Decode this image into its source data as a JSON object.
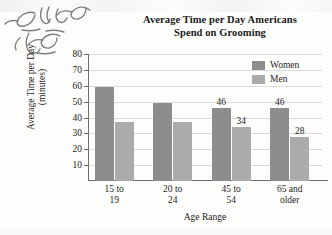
{
  "annotation": {
    "note": "handwritten-pencil-arabic-script",
    "ink_color": "#6b6b6b"
  },
  "legend": {
    "position": "top-right",
    "entries": [
      {
        "label": "Women",
        "color": "#8d8d8d"
      },
      {
        "label": "Men",
        "color": "#ababab"
      }
    ]
  },
  "chart_data": {
    "type": "bar",
    "title": "Average Time per Day Americans Spend on Grooming",
    "title_lines": [
      "Average Time per Day Americans",
      "Spend on Grooming"
    ],
    "xlabel": "Age Range",
    "ylabel": "Average Time per Day (minutes)",
    "ylabel_lines": [
      "Average Time per Day",
      "(minutes)"
    ],
    "categories": [
      "15 to 19",
      "20 to 24",
      "45 to 54",
      "65 and older"
    ],
    "category_lines": [
      [
        "15 to",
        "19"
      ],
      [
        "20 to",
        "24"
      ],
      [
        "45 to",
        "54"
      ],
      [
        "65 and",
        "older"
      ]
    ],
    "series": [
      {
        "name": "Women",
        "color": "#8d8d8d",
        "values": [
          59,
          49,
          46,
          46
        ],
        "labels": [
          "",
          "",
          "46",
          "46"
        ]
      },
      {
        "name": "Men",
        "color": "#ababab",
        "values": [
          37,
          37,
          34,
          28
        ],
        "labels": [
          "",
          "",
          "34",
          "28"
        ]
      }
    ],
    "ylim": [
      0,
      80
    ],
    "yticks": [
      80,
      70,
      60,
      50,
      40,
      30,
      20,
      10
    ],
    "grid": true,
    "legend_position": "top-right"
  }
}
